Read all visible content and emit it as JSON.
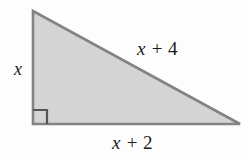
{
  "figure": {
    "kind": "right-triangle-diagram",
    "background_color": "#fdfdfd",
    "fill_color": "#d4d4d4",
    "stroke_color": "#838383",
    "text_color": "#1b1b1b",
    "stroke_width": 2.6,
    "vertices": {
      "apex": {
        "x": 33,
        "y": 11
      },
      "right_angle": {
        "x": 33,
        "y": 124
      },
      "base_right": {
        "x": 240,
        "y": 124
      }
    },
    "right_angle_marker": {
      "name": "right-angle-square",
      "x": 33,
      "y": 124,
      "size": 14
    },
    "labels": {
      "vertical_leg": {
        "variable": "x",
        "operator": "",
        "constant": ""
      },
      "hypotenuse": {
        "variable": "x",
        "operator": "+",
        "constant": "4"
      },
      "base": {
        "variable": "x",
        "operator": "+",
        "constant": "2"
      }
    }
  }
}
